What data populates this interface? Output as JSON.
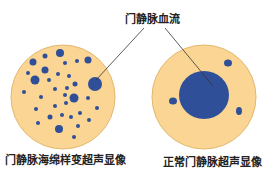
{
  "labels": {
    "top": "门静脉血流",
    "left_caption": "门静脉海绵样变超声显像",
    "right_caption": "正常门静脉超声显像"
  },
  "colors": {
    "tissue": "#fbd593",
    "tissue_edge": "#e3b870",
    "vessel": "#2f4f98",
    "leader_line": "#333333",
    "text": "#222222",
    "background": "#ffffff"
  },
  "left_panel": {
    "description": "Cavernous transformation: many small scattered vessels",
    "circle": {
      "cx": 63,
      "cy": 97,
      "r": 52
    },
    "vessels": [
      {
        "cx": 60,
        "cy": 53,
        "r": 4
      },
      {
        "cx": 33,
        "cy": 62,
        "r": 3.5
      },
      {
        "cx": 45,
        "cy": 56,
        "r": 2.5
      },
      {
        "cx": 88,
        "cy": 60,
        "r": 3.5
      },
      {
        "cx": 77,
        "cy": 61,
        "r": 2
      },
      {
        "cx": 65,
        "cy": 63,
        "r": 2
      },
      {
        "cx": 28,
        "cy": 73,
        "r": 2
      },
      {
        "cx": 45,
        "cy": 70,
        "r": 3.5
      },
      {
        "cx": 58,
        "cy": 74,
        "r": 2
      },
      {
        "cx": 35,
        "cy": 80,
        "r": 4.5
      },
      {
        "cx": 49,
        "cy": 80,
        "r": 2
      },
      {
        "cx": 69,
        "cy": 76,
        "r": 2
      },
      {
        "cx": 75,
        "cy": 84,
        "r": 2.5
      },
      {
        "cx": 95,
        "cy": 84,
        "r": 7
      },
      {
        "cx": 24,
        "cy": 92,
        "r": 2
      },
      {
        "cx": 55,
        "cy": 89,
        "r": 2
      },
      {
        "cx": 67,
        "cy": 88,
        "r": 2
      },
      {
        "cx": 41,
        "cy": 97,
        "r": 2
      },
      {
        "cx": 65,
        "cy": 95,
        "r": 2
      },
      {
        "cx": 74,
        "cy": 98,
        "r": 4.5
      },
      {
        "cx": 88,
        "cy": 98,
        "r": 2
      },
      {
        "cx": 55,
        "cy": 106,
        "r": 2
      },
      {
        "cx": 66,
        "cy": 103,
        "r": 2
      },
      {
        "cx": 36,
        "cy": 109,
        "r": 2
      },
      {
        "cx": 97,
        "cy": 108,
        "r": 2
      },
      {
        "cx": 50,
        "cy": 117,
        "r": 2.5
      },
      {
        "cx": 62,
        "cy": 115,
        "r": 2
      },
      {
        "cx": 71,
        "cy": 117,
        "r": 2
      },
      {
        "cx": 80,
        "cy": 113,
        "r": 2
      },
      {
        "cx": 89,
        "cy": 120,
        "r": 2
      },
      {
        "cx": 38,
        "cy": 123,
        "r": 2
      },
      {
        "cx": 59,
        "cy": 129,
        "r": 4
      },
      {
        "cx": 78,
        "cy": 126,
        "r": 2
      },
      {
        "cx": 74,
        "cy": 137,
        "r": 2
      }
    ]
  },
  "right_panel": {
    "description": "Normal portal vein: single large vessel",
    "circle": {
      "cx": 204,
      "cy": 97,
      "r": 52
    },
    "vessels": [
      {
        "cx": 204,
        "cy": 95,
        "rx": 25,
        "ry": 24
      },
      {
        "cx": 228,
        "cy": 63,
        "rx": 4,
        "ry": 3.5
      },
      {
        "cx": 173,
        "cy": 101,
        "rx": 4,
        "ry": 3.5
      },
      {
        "cx": 239,
        "cy": 111,
        "rx": 3,
        "ry": 4
      }
    ]
  },
  "leader_lines": [
    {
      "x1": 144,
      "y1": 28,
      "x2": 96,
      "y2": 80
    },
    {
      "x1": 165,
      "y1": 28,
      "x2": 213,
      "y2": 86
    }
  ]
}
